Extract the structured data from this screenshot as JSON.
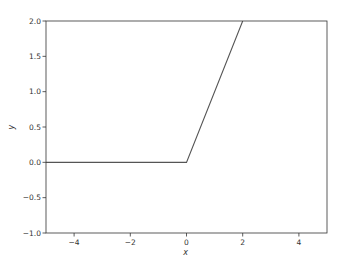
{
  "chart_data": {
    "type": "line",
    "title": "",
    "xlabel": "x",
    "ylabel": "y",
    "xlim": [
      -5,
      5
    ],
    "ylim": [
      -1.0,
      2.0
    ],
    "grid": false,
    "legend": null,
    "x_ticks": [
      -4,
      -2,
      0,
      2,
      4
    ],
    "x_tick_labels": [
      "−4",
      "−2",
      "0",
      "2",
      "4"
    ],
    "y_ticks": [
      -1.0,
      -0.5,
      0.0,
      0.5,
      1.0,
      1.5,
      2.0
    ],
    "y_tick_labels": [
      "−1.0",
      "−0.5",
      "0.0",
      "0.5",
      "1.0",
      "1.5",
      "2.0"
    ],
    "series": [
      {
        "name": "y",
        "color": "#555555",
        "x": [
          -5,
          0,
          2
        ],
        "y": [
          0,
          0,
          2
        ]
      }
    ]
  },
  "layout": {
    "plot_left": 46,
    "plot_right": 327,
    "plot_top": 21,
    "plot_bottom": 233,
    "frame_color": "#333333"
  }
}
